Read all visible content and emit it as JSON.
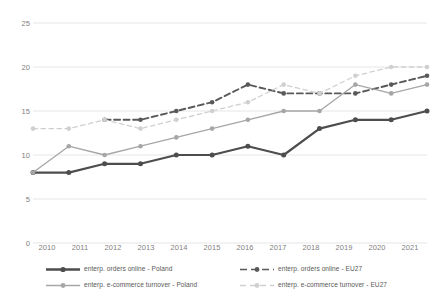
{
  "chart_data": {
    "type": "line",
    "title": "",
    "subtitle": "",
    "xlabel": "",
    "ylabel": "",
    "categories": [
      "2010",
      "2011",
      "2012",
      "2013",
      "2014",
      "2015",
      "2016",
      "2017",
      "2018",
      "2019",
      "2020",
      "2021"
    ],
    "ylim": [
      0,
      25
    ],
    "yticks": [
      0,
      5,
      10,
      15,
      20,
      25
    ],
    "grid": "horizontal",
    "legend_position": "bottom",
    "series": [
      {
        "name": "enterp. orders online - Poland",
        "color": "#4d4d4d",
        "style": "solid",
        "marker": "circle",
        "values": [
          8,
          8,
          9,
          9,
          10,
          10,
          11,
          10,
          13,
          14,
          14,
          15
        ]
      },
      {
        "name": "enterp. orders online - EU27",
        "color": "#595959",
        "style": "dashed",
        "marker": "circle",
        "values": [
          null,
          null,
          14,
          14,
          15,
          16,
          18,
          17,
          17,
          17,
          18,
          19
        ]
      },
      {
        "name": "enterp. e-commerce turnover - Poland",
        "color": "#a6a6a6",
        "style": "solid",
        "marker": "circle",
        "values": [
          8,
          11,
          10,
          11,
          12,
          13,
          14,
          15,
          15,
          18,
          17,
          18
        ]
      },
      {
        "name": "enterp. e-commerce turnover - EU27",
        "color": "#d0d0d0",
        "style": "dashed",
        "marker": "circle",
        "values": [
          13,
          13,
          14,
          13,
          14,
          15,
          16,
          18,
          17,
          19,
          20,
          20
        ]
      }
    ]
  },
  "axis": {
    "y_labels": [
      "25",
      "20",
      "15",
      "10",
      "5",
      "0"
    ],
    "x_labels": [
      "2010",
      "2011",
      "2012",
      "2013",
      "2014",
      "2015",
      "2016",
      "2017",
      "2018",
      "2019",
      "2020",
      "2021"
    ]
  },
  "legend": {
    "items": [
      {
        "label": "enterp. orders online - Poland"
      },
      {
        "label": "enterp. orders online - EU27"
      },
      {
        "label": "enterp. e-commerce turnover - Poland"
      },
      {
        "label": "enterp. e-commerce turnover - EU27"
      }
    ]
  }
}
